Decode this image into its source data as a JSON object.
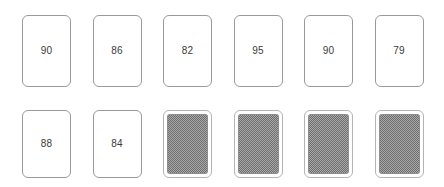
{
  "board": {
    "title": "Card Board",
    "background_color": "#ffffff",
    "card_border_color": "#9a9a9a",
    "card_value_color": "#3a3a3a",
    "card_back_color": "#a8a8a8",
    "columns": 6,
    "rows": 2
  },
  "rows": [
    {
      "name": "top-row",
      "cards": [
        {
          "value": "90",
          "face": "up",
          "back_label": ""
        },
        {
          "value": "86",
          "face": "up",
          "back_label": ""
        },
        {
          "value": "82",
          "face": "up",
          "back_label": ""
        },
        {
          "value": "95",
          "face": "up",
          "back_label": ""
        },
        {
          "value": "90",
          "face": "up",
          "back_label": ""
        },
        {
          "value": "79",
          "face": "up",
          "back_label": ""
        }
      ]
    },
    {
      "name": "bottom-row",
      "cards": [
        {
          "value": "88",
          "face": "up",
          "back_label": ""
        },
        {
          "value": "84",
          "face": "up",
          "back_label": ""
        },
        {
          "value": "",
          "face": "down",
          "back_label": ""
        },
        {
          "value": "",
          "face": "down",
          "back_label": ""
        },
        {
          "value": "",
          "face": "down",
          "back_label": ""
        },
        {
          "value": "",
          "face": "down",
          "back_label": ""
        }
      ]
    }
  ]
}
